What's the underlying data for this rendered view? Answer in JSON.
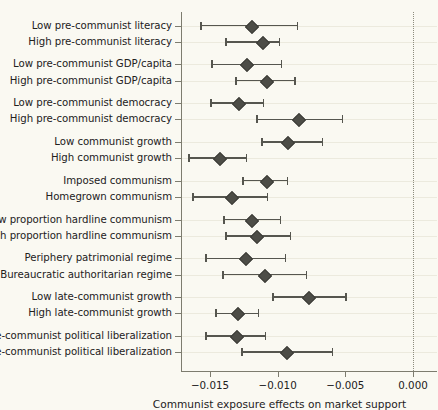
{
  "chart_data": {
    "type": "scatter",
    "title": "",
    "xlabel": "Communist exposure effects on market support",
    "ylabel": "",
    "xlim": [
      -0.0168,
      0.0006
    ],
    "xticks": [
      -0.015,
      -0.01,
      -0.005,
      0.0
    ],
    "xtick_labels": [
      "−0.015",
      "−0.010",
      "−0.005",
      "0.000"
    ],
    "grid": "horizontal faint gridlines per row; dotted vertical reference line at 0.000",
    "legend": "none",
    "marker": "diamond",
    "error_bars": "horizontal confidence intervals with end caps",
    "categories": [
      "Low pre-communist literacy",
      "High pre-communist literacy",
      "Low pre-communist GDP/capita",
      "High pre-communist GDP/capita",
      "Low pre-communist democracy",
      "High pre-communist democracy",
      "Low communist growth",
      "High communist growth",
      "Imposed communism",
      "Homegrown communism",
      "Low proportion hardline communism",
      "High proportion hardline communism",
      "Periphery patrimonial regime",
      "Bureaucratic authoritarian regime",
      "Low late-communist growth",
      "High late-communist growth",
      "No late-communist political liberalization",
      "Late-communist political liberalization"
    ],
    "group_breaks_after": [
      1,
      3,
      5,
      7,
      9,
      11,
      13,
      15
    ],
    "points": [
      {
        "label": "Low pre-communist literacy",
        "estimate": -0.01196,
        "ci_low": -0.01572,
        "ci_high": -0.00848
      },
      {
        "label": "High pre-communist literacy",
        "estimate": -0.01116,
        "ci_low": -0.01387,
        "ci_high": -0.0098
      },
      {
        "label": "Low pre-communist GDP/capita",
        "estimate": -0.01233,
        "ci_low": -0.01491,
        "ci_high": -0.00967
      },
      {
        "label": "High pre-communist GDP/capita",
        "estimate": -0.01085,
        "ci_low": -0.01314,
        "ci_high": -0.00864
      },
      {
        "label": "Low pre-communist democracy",
        "estimate": -0.01292,
        "ci_low": -0.01498,
        "ci_high": -0.011
      },
      {
        "label": "High pre-communist democracy",
        "estimate": -0.00849,
        "ci_low": -0.01159,
        "ci_high": -0.00516
      },
      {
        "label": "Low communist growth",
        "estimate": -0.0093,
        "ci_low": -0.01122,
        "ci_high": -0.00664
      },
      {
        "label": "High communist growth",
        "estimate": -0.01433,
        "ci_low": -0.01661,
        "ci_high": -0.01225
      },
      {
        "label": "Imposed communism",
        "estimate": -0.01085,
        "ci_low": -0.01262,
        "ci_high": -0.00922
      },
      {
        "label": "Homegrown communism",
        "estimate": -0.01343,
        "ci_low": -0.01631,
        "ci_high": -0.0107
      },
      {
        "label": "Low proportion hardline communism",
        "estimate": -0.01196,
        "ci_low": -0.01402,
        "ci_high": -0.00974
      },
      {
        "label": "High proportion hardline communism",
        "estimate": -0.01159,
        "ci_low": -0.01387,
        "ci_high": -0.009
      },
      {
        "label": "Periphery patrimonial regime",
        "estimate": -0.0124,
        "ci_low": -0.01535,
        "ci_high": -0.00937
      },
      {
        "label": "Bureaucratic authoritarian regime",
        "estimate": -0.011,
        "ci_low": -0.01409,
        "ci_high": -0.00782
      },
      {
        "label": "Low late-communist growth",
        "estimate": -0.00775,
        "ci_low": -0.01041,
        "ci_high": -0.00487
      },
      {
        "label": "High late-communist growth",
        "estimate": -0.01299,
        "ci_low": -0.01461,
        "ci_high": -0.01137
      },
      {
        "label": "No late-communist political liberalization",
        "estimate": -0.01306,
        "ci_low": -0.01535,
        "ci_high": -0.01085
      },
      {
        "label": "Late-communist political liberalization",
        "estimate": -0.00937,
        "ci_low": -0.01269,
        "ci_high": -0.0059
      }
    ],
    "zero_reference": 0.0
  },
  "colors": {
    "background": "#faf9f2",
    "marker": "#4d4d47",
    "interval": "#56564f",
    "axis": "#7d7c6f",
    "gridline": "#eceade",
    "text": "#23211c"
  }
}
